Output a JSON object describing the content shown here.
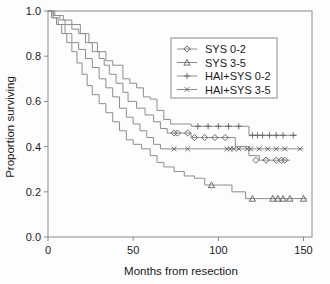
{
  "chart_data": {
    "type": "line",
    "subtype": "kaplan-meier-survival",
    "title": "",
    "xlabel": "Months from resection",
    "ylabel": "Proportion surviving",
    "xlim": [
      0,
      155
    ],
    "ylim": [
      0.0,
      1.0
    ],
    "xticks": [
      0,
      50,
      100,
      150
    ],
    "xticklabels": [
      "0",
      "50",
      "100",
      "150"
    ],
    "yticks": [
      0.0,
      0.2,
      0.4,
      0.6,
      0.8,
      1.0
    ],
    "yticklabels": [
      "0.0",
      "0.2",
      "0.4",
      "0.6",
      "0.8",
      "1.0"
    ],
    "grid": false,
    "legend_position": "upper-right",
    "line_color": "#8d8d8d",
    "marker_color": "#5e5e5e",
    "series": [
      {
        "name": "SYS 0-2",
        "marker": "diamond",
        "steps": [
          [
            0,
            1.0
          ],
          [
            3,
            0.98
          ],
          [
            7,
            0.96
          ],
          [
            10,
            0.94
          ],
          [
            14,
            0.92
          ],
          [
            18,
            0.9
          ],
          [
            22,
            0.86
          ],
          [
            26,
            0.82
          ],
          [
            30,
            0.79
          ],
          [
            33,
            0.76
          ],
          [
            36,
            0.72
          ],
          [
            40,
            0.68
          ],
          [
            44,
            0.64
          ],
          [
            47,
            0.6
          ],
          [
            52,
            0.57
          ],
          [
            57,
            0.54
          ],
          [
            62,
            0.51
          ],
          [
            66,
            0.48
          ],
          [
            70,
            0.46
          ],
          [
            76,
            0.46
          ],
          [
            84,
            0.44
          ],
          [
            92,
            0.44
          ],
          [
            104,
            0.44
          ],
          [
            110,
            0.4
          ],
          [
            118,
            0.36
          ],
          [
            124,
            0.34
          ],
          [
            142,
            0.34
          ]
        ],
        "censored": [
          [
            74,
            0.46
          ],
          [
            76,
            0.46
          ],
          [
            82,
            0.46
          ],
          [
            86,
            0.44
          ],
          [
            92,
            0.44
          ],
          [
            98,
            0.44
          ],
          [
            104,
            0.44
          ],
          [
            122,
            0.34
          ],
          [
            128,
            0.34
          ],
          [
            134,
            0.34
          ],
          [
            137,
            0.34
          ],
          [
            139,
            0.34
          ]
        ]
      },
      {
        "name": "SYS 3-5",
        "marker": "triangle",
        "steps": [
          [
            0,
            1.0
          ],
          [
            2,
            0.97
          ],
          [
            5,
            0.94
          ],
          [
            8,
            0.9
          ],
          [
            11,
            0.86
          ],
          [
            14,
            0.82
          ],
          [
            17,
            0.77
          ],
          [
            20,
            0.72
          ],
          [
            23,
            0.67
          ],
          [
            26,
            0.63
          ],
          [
            30,
            0.59
          ],
          [
            34,
            0.55
          ],
          [
            38,
            0.51
          ],
          [
            42,
            0.47
          ],
          [
            46,
            0.43
          ],
          [
            50,
            0.41
          ],
          [
            55,
            0.39
          ],
          [
            60,
            0.36
          ],
          [
            64,
            0.33
          ],
          [
            68,
            0.31
          ],
          [
            74,
            0.29
          ],
          [
            80,
            0.27
          ],
          [
            86,
            0.26
          ],
          [
            92,
            0.23
          ],
          [
            100,
            0.23
          ],
          [
            108,
            0.2
          ],
          [
            116,
            0.17
          ],
          [
            152,
            0.17
          ]
        ],
        "censored": [
          [
            96,
            0.23
          ],
          [
            120,
            0.17
          ],
          [
            132,
            0.17
          ],
          [
            135,
            0.17
          ],
          [
            138,
            0.17
          ],
          [
            142,
            0.17
          ],
          [
            150,
            0.17
          ]
        ]
      },
      {
        "name": "HAI+SYS 0-2",
        "marker": "plus",
        "steps": [
          [
            0,
            1.0
          ],
          [
            4,
            0.98
          ],
          [
            9,
            0.96
          ],
          [
            14,
            0.94
          ],
          [
            19,
            0.9
          ],
          [
            24,
            0.86
          ],
          [
            29,
            0.82
          ],
          [
            34,
            0.78
          ],
          [
            38,
            0.76
          ],
          [
            44,
            0.7
          ],
          [
            48,
            0.68
          ],
          [
            52,
            0.66
          ],
          [
            56,
            0.62
          ],
          [
            60,
            0.61
          ],
          [
            64,
            0.56
          ],
          [
            68,
            0.52
          ],
          [
            72,
            0.5
          ],
          [
            78,
            0.5
          ],
          [
            84,
            0.49
          ],
          [
            113,
            0.49
          ],
          [
            118,
            0.45
          ],
          [
            146,
            0.45
          ]
        ],
        "censored": [
          [
            88,
            0.49
          ],
          [
            94,
            0.49
          ],
          [
            100,
            0.49
          ],
          [
            106,
            0.49
          ],
          [
            112,
            0.49
          ],
          [
            120,
            0.45
          ],
          [
            123,
            0.45
          ],
          [
            126,
            0.45
          ],
          [
            130,
            0.45
          ],
          [
            134,
            0.45
          ],
          [
            138,
            0.45
          ],
          [
            144,
            0.45
          ]
        ]
      },
      {
        "name": "HAI+SYS 3-5",
        "marker": "x",
        "steps": [
          [
            0,
            1.0
          ],
          [
            3,
            0.97
          ],
          [
            6,
            0.94
          ],
          [
            10,
            0.9
          ],
          [
            14,
            0.86
          ],
          [
            18,
            0.83
          ],
          [
            22,
            0.79
          ],
          [
            26,
            0.75
          ],
          [
            30,
            0.7
          ],
          [
            34,
            0.66
          ],
          [
            38,
            0.62
          ],
          [
            42,
            0.57
          ],
          [
            46,
            0.53
          ],
          [
            50,
            0.5
          ],
          [
            54,
            0.47
          ],
          [
            58,
            0.44
          ],
          [
            62,
            0.41
          ],
          [
            66,
            0.39
          ],
          [
            74,
            0.39
          ],
          [
            150,
            0.39
          ]
        ],
        "censored": [
          [
            74,
            0.39
          ],
          [
            82,
            0.39
          ],
          [
            105,
            0.39
          ],
          [
            107,
            0.39
          ],
          [
            109,
            0.39
          ],
          [
            112,
            0.39
          ],
          [
            117,
            0.39
          ],
          [
            119,
            0.39
          ],
          [
            124,
            0.39
          ],
          [
            129,
            0.39
          ],
          [
            134,
            0.39
          ],
          [
            139,
            0.39
          ],
          [
            148,
            0.39
          ]
        ]
      }
    ]
  },
  "legend": {
    "entries": [
      {
        "label": "SYS 0-2"
      },
      {
        "label": "SYS 3-5"
      },
      {
        "label": "HAI+SYS 0-2"
      },
      {
        "label": "HAI+SYS 3-5"
      }
    ]
  }
}
